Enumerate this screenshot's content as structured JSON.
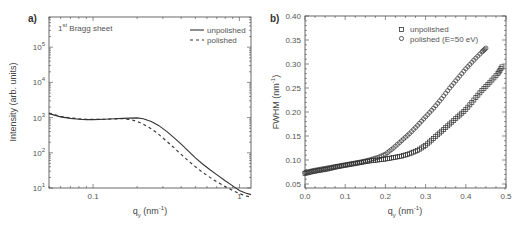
{
  "chart_data": [
    {
      "panel": "a)",
      "type": "line",
      "annotation": "1st Bragg sheet",
      "xlabel": "q_y (nm^-1)",
      "ylabel": "Intensity (arb. units)",
      "xscale": "log",
      "yscale": "log",
      "xlim": [
        0.05,
        1.2
      ],
      "ylim": [
        10.0,
        1000000.0
      ],
      "xticks": [
        0.1,
        1
      ],
      "xtick_labels": [
        "0.1",
        "1"
      ],
      "yticks": [
        10.0,
        100.0,
        1000.0,
        10000.0,
        100000.0
      ],
      "ytick_labels": [
        "10^1",
        "10^2",
        "10^3",
        "10^4",
        "10^5"
      ],
      "legend": {
        "position": "upper right",
        "entries": [
          "unpolished",
          "polished"
        ]
      },
      "grid": false,
      "series": [
        {
          "name": "unpolished",
          "style": "solid",
          "x": [
            0.05,
            0.06,
            0.07,
            0.08,
            0.09,
            0.1,
            0.12,
            0.14,
            0.16,
            0.18,
            0.2,
            0.22,
            0.25,
            0.28,
            0.32,
            0.36,
            0.4,
            0.45,
            0.5,
            0.56,
            0.63,
            0.7,
            0.8,
            0.9,
            1.0,
            1.1,
            1.2
          ],
          "y": [
            1300,
            1050,
            950,
            900,
            880,
            880,
            900,
            930,
            950,
            970,
            980,
            930,
            780,
            600,
            400,
            260,
            175,
            110,
            72,
            48,
            33,
            24,
            16,
            11.5,
            8.5,
            7.2,
            6.5
          ]
        },
        {
          "name": "polished",
          "style": "dashed",
          "x": [
            0.05,
            0.06,
            0.07,
            0.08,
            0.09,
            0.1,
            0.12,
            0.14,
            0.16,
            0.18,
            0.2,
            0.22,
            0.25,
            0.28,
            0.32,
            0.36,
            0.4,
            0.45,
            0.5,
            0.56,
            0.63,
            0.7,
            0.8,
            0.9,
            1.0,
            1.1,
            1.2
          ],
          "y": [
            1350,
            1080,
            980,
            930,
            900,
            890,
            900,
            920,
            930,
            880,
            780,
            650,
            480,
            340,
            210,
            135,
            90,
            58,
            40,
            28,
            20,
            15,
            11,
            8.5,
            7.0,
            6.0,
            5.5
          ]
        }
      ]
    },
    {
      "panel": "b)",
      "type": "scatter",
      "xlabel": "q_y (nm^-1)",
      "ylabel": "FWHM (nm^-1)",
      "xlim": [
        0.0,
        0.5
      ],
      "ylim": [
        0.04,
        0.4
      ],
      "xticks": [
        0.0,
        0.1,
        0.2,
        0.3,
        0.4,
        0.5
      ],
      "xtick_labels": [
        "0.0",
        "0.1",
        "0.2",
        "0.3",
        "0.4",
        "0.5"
      ],
      "yticks": [
        0.05,
        0.1,
        0.15,
        0.2,
        0.25,
        0.3,
        0.35,
        0.4
      ],
      "ytick_labels": [
        "0.05",
        "0.10",
        "0.15",
        "0.20",
        "0.25",
        "0.30",
        "0.35",
        "0.40"
      ],
      "legend": {
        "position": "upper center",
        "entries": [
          "unpolished",
          "polished (E=50 eV)"
        ]
      },
      "grid": false,
      "series": [
        {
          "name": "unpolished",
          "marker": "square",
          "x": [
            0.0,
            0.02,
            0.04,
            0.06,
            0.08,
            0.1,
            0.12,
            0.14,
            0.16,
            0.18,
            0.2,
            0.22,
            0.24,
            0.26,
            0.28,
            0.3,
            0.32,
            0.34,
            0.36,
            0.38,
            0.4,
            0.42,
            0.44,
            0.46,
            0.48,
            0.49
          ],
          "y": [
            0.072,
            0.076,
            0.079,
            0.082,
            0.086,
            0.089,
            0.092,
            0.095,
            0.098,
            0.1,
            0.102,
            0.105,
            0.108,
            0.113,
            0.12,
            0.13,
            0.145,
            0.16,
            0.175,
            0.19,
            0.205,
            0.225,
            0.245,
            0.262,
            0.28,
            0.294
          ]
        },
        {
          "name": "polished (E=50 eV)",
          "marker": "circle",
          "x": [
            0.0,
            0.02,
            0.04,
            0.06,
            0.08,
            0.1,
            0.12,
            0.14,
            0.16,
            0.18,
            0.2,
            0.22,
            0.24,
            0.26,
            0.28,
            0.3,
            0.32,
            0.34,
            0.36,
            0.38,
            0.4,
            0.42,
            0.44,
            0.45
          ],
          "y": [
            0.074,
            0.078,
            0.081,
            0.084,
            0.087,
            0.09,
            0.093,
            0.096,
            0.1,
            0.105,
            0.112,
            0.125,
            0.14,
            0.155,
            0.172,
            0.19,
            0.208,
            0.228,
            0.25,
            0.27,
            0.29,
            0.308,
            0.325,
            0.333
          ]
        }
      ]
    }
  ]
}
